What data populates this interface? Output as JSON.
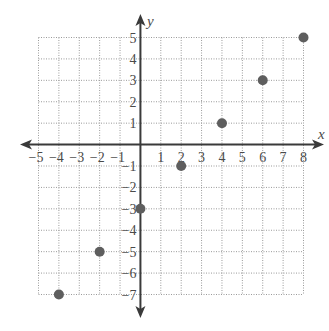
{
  "chart_data": {
    "type": "scatter",
    "title": "",
    "xlabel": "x",
    "ylabel": "y",
    "xlim": [
      -5,
      8
    ],
    "ylim": [
      -7,
      5
    ],
    "grid": true,
    "grid_style": "dotted",
    "legend": null,
    "x_ticks": [
      -5,
      -4,
      -3,
      -2,
      -1,
      1,
      2,
      3,
      4,
      5,
      6,
      7,
      8
    ],
    "y_ticks": [
      -7,
      -6,
      -5,
      -4,
      -3,
      -2,
      -1,
      1,
      2,
      3,
      4,
      5
    ],
    "x_tick_labels": [
      "−5",
      "−4",
      "−3",
      "−2",
      "−1",
      "1",
      "2",
      "3",
      "4",
      "5",
      "6",
      "7",
      "8"
    ],
    "y_tick_labels": [
      "−7",
      "−6",
      "−5",
      "−4",
      "−3",
      "−2",
      "−1",
      "1",
      "2",
      "3",
      "4",
      "5"
    ],
    "series": [
      {
        "name": "points",
        "color": "#5e5e5e",
        "points": [
          {
            "x": -4,
            "y": -7
          },
          {
            "x": -2,
            "y": -5
          },
          {
            "x": 0,
            "y": -3
          },
          {
            "x": 2,
            "y": -1
          },
          {
            "x": 4,
            "y": 1
          },
          {
            "x": 6,
            "y": 3
          },
          {
            "x": 8,
            "y": 5
          }
        ]
      }
    ]
  },
  "colors": {
    "axis": "#3a3a3a",
    "grid": "#9a9a9a",
    "point": "#5e5e5e",
    "label": "#4a4a4a"
  }
}
